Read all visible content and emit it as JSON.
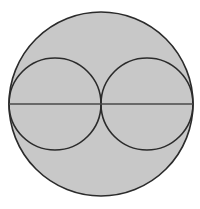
{
  "figure": {
    "background_color": "#ffffff",
    "fill_color": "#c8c8c8",
    "stroke_color": "#2b2b2b",
    "line_color": "#4a4a4a",
    "canvas": {
      "width": 200,
      "height": 209
    },
    "shapes": {
      "outer_circle": {
        "label": "outer-circle",
        "cx": 101,
        "cy": 104,
        "r": 92,
        "fill": "#c8c8c8",
        "stroke": "#2b2b2b",
        "stroke_width": 1.6
      },
      "left_circle": {
        "label": "left-inner-circle",
        "cx": 55,
        "cy": 104,
        "r": 46,
        "fill": "none",
        "stroke": "#2b2b2b",
        "stroke_width": 1.6
      },
      "right_circle": {
        "label": "right-inner-circle",
        "cx": 147,
        "cy": 104,
        "r": 46,
        "fill": "none",
        "stroke": "#2b2b2b",
        "stroke_width": 1.6
      },
      "diameter_line": {
        "label": "horizontal-diameter",
        "x1": 9,
        "y1": 104,
        "x2": 193,
        "y2": 104,
        "stroke": "#4a4a4a",
        "stroke_width": 1.6
      }
    }
  }
}
